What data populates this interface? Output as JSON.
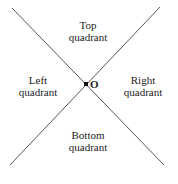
{
  "diagram": {
    "lines": [
      {
        "name": "diagonal-line-descending",
        "x1": 12,
        "y1": 8,
        "x2": 164,
        "y2": 165
      },
      {
        "name": "diagonal-line-ascending",
        "x1": 160,
        "y1": 7,
        "x2": 10,
        "y2": 165
      }
    ],
    "origin": {
      "label": "O",
      "x": 86,
      "y": 84
    },
    "quadrants": {
      "top": {
        "line1": "Top",
        "line2": "quadrant"
      },
      "left": {
        "line1": "Left",
        "line2": "quadrant"
      },
      "right": {
        "line1": "Right",
        "line2": "quadrant"
      },
      "bottom": {
        "line1": "Bottom",
        "line2": "quadrant"
      }
    },
    "colors": {
      "line": "#555555",
      "text": "#222222",
      "origin_marker": "#111111"
    }
  }
}
